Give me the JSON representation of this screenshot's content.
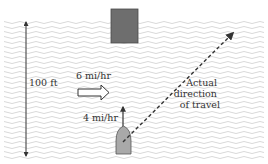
{
  "diagram": {
    "river_width_label": "100 ft",
    "current_label": "6 mi/hr",
    "boat_speed_label": "4 mi/hr",
    "resultant_label": {
      "line1": "Actual",
      "line2": "direction",
      "line3": "of travel"
    },
    "colors": {
      "water_wave": "#d4d4d4",
      "dock_fill": "#6e6e6e",
      "dock_stroke": "#4a4a4a",
      "boat_fill": "#a9a9a9",
      "boat_stroke": "#555555",
      "line": "#333333",
      "background": "#ffffff"
    }
  }
}
